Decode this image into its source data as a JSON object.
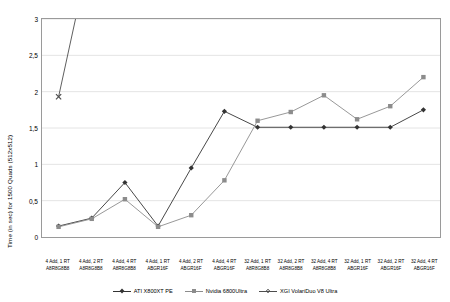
{
  "chart_data": {
    "type": "line",
    "title": "",
    "xlabel": "",
    "ylabel": "Time (in sec) for 1500 Quads (512x512)",
    "ylim": [
      0,
      3
    ],
    "yticks": [
      0,
      0.5,
      1,
      1.5,
      2,
      2.5,
      3
    ],
    "ytick_labels": [
      "0",
      "0,5",
      "1",
      "1,5",
      "2",
      "2,5",
      "3"
    ],
    "grid": true,
    "legend_position": "bottom",
    "categories": [
      {
        "line1": "4 Add, 1 RT",
        "line2": "A8R8G8B8"
      },
      {
        "line1": "4 Add, 2 RT",
        "line2": "A8R8G8B8"
      },
      {
        "line1": "4 Add, 4 RT",
        "line2": "A8R8G8B8"
      },
      {
        "line1": "4 Add, 1 RT",
        "line2": "ABGR16F"
      },
      {
        "line1": "4 Add, 2 RT",
        "line2": "ABGR16F"
      },
      {
        "line1": "4 Add, 4 RT",
        "line2": "ABGR16F"
      },
      {
        "line1": "32 Add, 1 RT",
        "line2": "A8R8G8B8"
      },
      {
        "line1": "32 Add, 2 RT",
        "line2": "A8R8G8B8"
      },
      {
        "line1": "32 Add, 4 RT",
        "line2": "A8R8G8B8"
      },
      {
        "line1": "32 Add, 1 RT",
        "line2": "ABGR16F"
      },
      {
        "line1": "32 Add, 2 RT",
        "line2": "ABGR16F"
      },
      {
        "line1": "32 Add, 4 RT",
        "line2": "ABGR16F"
      }
    ],
    "series": [
      {
        "name": "ATI X800XT PE",
        "color": "#333333",
        "marker": "diamond",
        "values": [
          0.15,
          0.26,
          0.75,
          0.15,
          0.95,
          1.73,
          1.51,
          1.51,
          1.51,
          1.51,
          1.51,
          1.75
        ]
      },
      {
        "name": "Nvidia 6800Ultra",
        "color": "#8c8c8c",
        "marker": "square",
        "values": [
          0.14,
          0.25,
          0.52,
          0.14,
          0.3,
          0.78,
          1.6,
          1.72,
          1.95,
          1.62,
          1.8,
          2.2
        ]
      },
      {
        "name": "XGI VolariDuo V8 Ultra",
        "color": "#4d4d4d",
        "marker": "cross",
        "values": [
          1.93,
          null,
          null,
          null,
          null,
          null,
          null,
          null,
          null,
          null,
          null,
          null
        ],
        "note": "second point exceeds axis maximum; line exits top of plot"
      }
    ]
  }
}
